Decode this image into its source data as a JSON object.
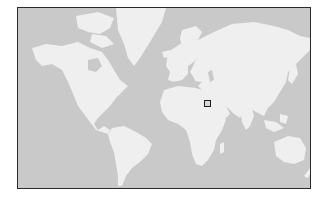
{
  "map": {
    "type": "world-map",
    "projection": "mercator",
    "colors": {
      "ocean": "#c9c9c9",
      "land": "#efefef",
      "frame": "#2a2a2a",
      "marker": "#1e1e1e"
    },
    "marker": {
      "shape": "square",
      "region": "Arabian Peninsula / Persian Gulf",
      "x": 204,
      "y": 100
    }
  }
}
